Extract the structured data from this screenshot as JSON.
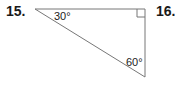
{
  "problems": [
    {
      "number": "15."
    },
    {
      "number": "16."
    }
  ],
  "triangle": {
    "type": "right triangle",
    "vertices": {
      "top_left": [
        35,
        9
      ],
      "top_right": [
        145,
        9
      ],
      "bottom_right": [
        145,
        77
      ]
    },
    "right_angle_at": "top_right",
    "angles": [
      {
        "label": "30°",
        "vertex": "top_left"
      },
      {
        "label": "60°",
        "vertex": "bottom_right"
      }
    ],
    "stroke_color": "#777777"
  }
}
